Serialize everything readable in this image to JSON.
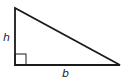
{
  "diagram": {
    "type": "right-triangle",
    "labels": {
      "height": "h",
      "base": "b"
    },
    "vertices": {
      "top": [
        15,
        8
      ],
      "right_angle": [
        15,
        65
      ],
      "base_end": [
        120,
        65
      ]
    },
    "right_angle_marker_size": 11,
    "stroke_color": "#1a1a1a"
  }
}
